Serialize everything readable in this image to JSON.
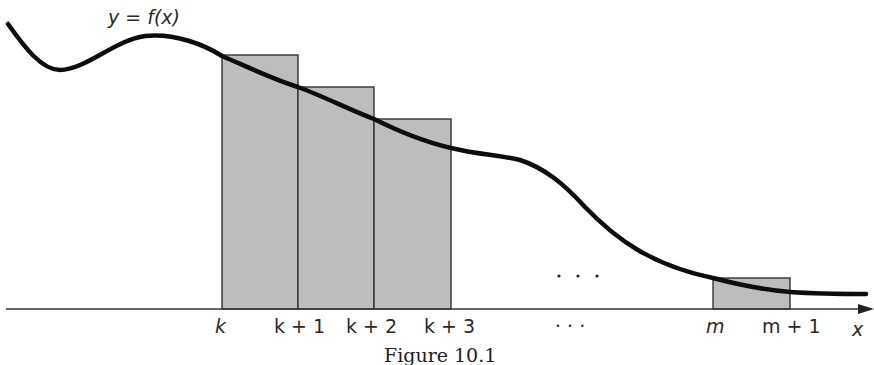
{
  "figure": {
    "caption": "Figure 10.1",
    "function_label": "y = f(x)",
    "axis_label": "x",
    "tick_labels": [
      "k",
      "k + 1",
      "k + 2",
      "k + 3",
      "· · ·",
      "m",
      "m + 1"
    ],
    "ellipsis_above": "· · ·",
    "colors": {
      "rect_fill": "#bdbdbd",
      "rect_stroke": "#333333",
      "curve": "#0d0d0d",
      "axis": "#333333",
      "background": "#ffffff"
    },
    "rectangles": [
      {
        "from": "k",
        "to": "k + 1",
        "x0": 222,
        "x1": 298,
        "top": 55
      },
      {
        "from": "k + 1",
        "to": "k + 2",
        "x0": 298,
        "x1": 374,
        "top": 87
      },
      {
        "from": "k + 2",
        "to": "k + 3",
        "x0": 374,
        "x1": 451,
        "top": 119
      },
      {
        "from": "m",
        "to": "m + 1",
        "x0": 713,
        "x1": 790,
        "top": 278
      }
    ]
  }
}
